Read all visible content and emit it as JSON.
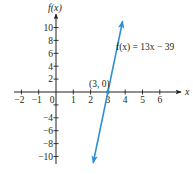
{
  "chart_data": {
    "type": "line",
    "title": "",
    "xlabel": "x",
    "ylabel": "f(x)",
    "xlim": [
      -2,
      6
    ],
    "ylim": [
      -10,
      10
    ],
    "x_ticks": [
      -2,
      -1,
      0,
      1,
      2,
      3,
      4,
      5,
      6
    ],
    "x_tick_labels": [
      "−2",
      "−1",
      "0",
      "1",
      "2",
      "3",
      "4",
      "5",
      "6"
    ],
    "y_ticks": [
      -10,
      -8,
      -6,
      -4,
      -2,
      2,
      4,
      6,
      8,
      10
    ],
    "y_tick_labels": [
      "−10",
      "−8",
      "−6",
      "−4",
      "",
      "2",
      "4",
      "6",
      "8",
      "10"
    ],
    "grid": false,
    "series": [
      {
        "name": "f(x) = 13x − 39",
        "equation": "f(x) = 13x − 39",
        "slope": 13,
        "intercept": -39,
        "x": [
          2.15,
          3,
          3.85
        ],
        "y": [
          -11,
          0,
          11
        ],
        "color": "#2e8fd0"
      }
    ],
    "annotations": [
      {
        "text": "(3, 0)",
        "x": 3,
        "y": 0
      },
      {
        "text": "f(x) = 13x − 39",
        "x": 4,
        "y": 7.5
      }
    ]
  },
  "labels": {
    "y_axis_title": "f(x)",
    "x_axis_title": "x",
    "point_label": "(3, 0)",
    "equation_label": "f(x) = 13x − 39"
  },
  "colors": {
    "axis": "#231f20",
    "line": "#2e8fd0"
  }
}
